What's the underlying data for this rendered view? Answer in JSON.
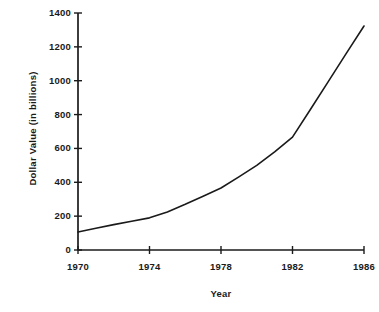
{
  "figure": {
    "background_color": "#ffffff",
    "ink_color": "#1a1a1a"
  },
  "chart_data": {
    "type": "line",
    "title": "",
    "subtitle": "",
    "xlabel": "Year",
    "ylabel": "Dollar Value (in billions)",
    "xlim": [
      1970,
      1986
    ],
    "ylim": [
      0,
      1400
    ],
    "xticks": [
      1970,
      1974,
      1978,
      1982,
      1986
    ],
    "xtick_labels": [
      "1970",
      "1974",
      "1978",
      "1982",
      "1986"
    ],
    "yticks": [
      0,
      200,
      400,
      600,
      800,
      1000,
      1200,
      1400
    ],
    "ytick_labels": [
      "0",
      "200",
      "400",
      "600",
      "800",
      "1000",
      "1200",
      "1400"
    ],
    "grid": false,
    "legend": false,
    "legend_position": "none",
    "line_color": "#1a1a1a",
    "line_width": 1.6,
    "markers": false,
    "x": [
      1970,
      1971,
      1972,
      1973,
      1974,
      1975,
      1976,
      1977,
      1978,
      1979,
      1980,
      1981,
      1982,
      1983,
      1984,
      1985,
      1986
    ],
    "values": [
      106,
      128,
      150,
      170,
      190,
      225,
      270,
      318,
      366,
      432,
      500,
      580,
      667,
      830,
      995,
      1160,
      1323
    ],
    "series": [
      {
        "name": "Dollar Value",
        "values": [
          106,
          128,
          150,
          170,
          190,
          225,
          270,
          318,
          366,
          432,
          500,
          580,
          667,
          830,
          995,
          1160,
          1323
        ]
      }
    ],
    "annotations": []
  },
  "axis_geometry": {
    "plot_left": 78,
    "plot_right": 364,
    "plot_bottom": 250,
    "plot_top": 13
  }
}
